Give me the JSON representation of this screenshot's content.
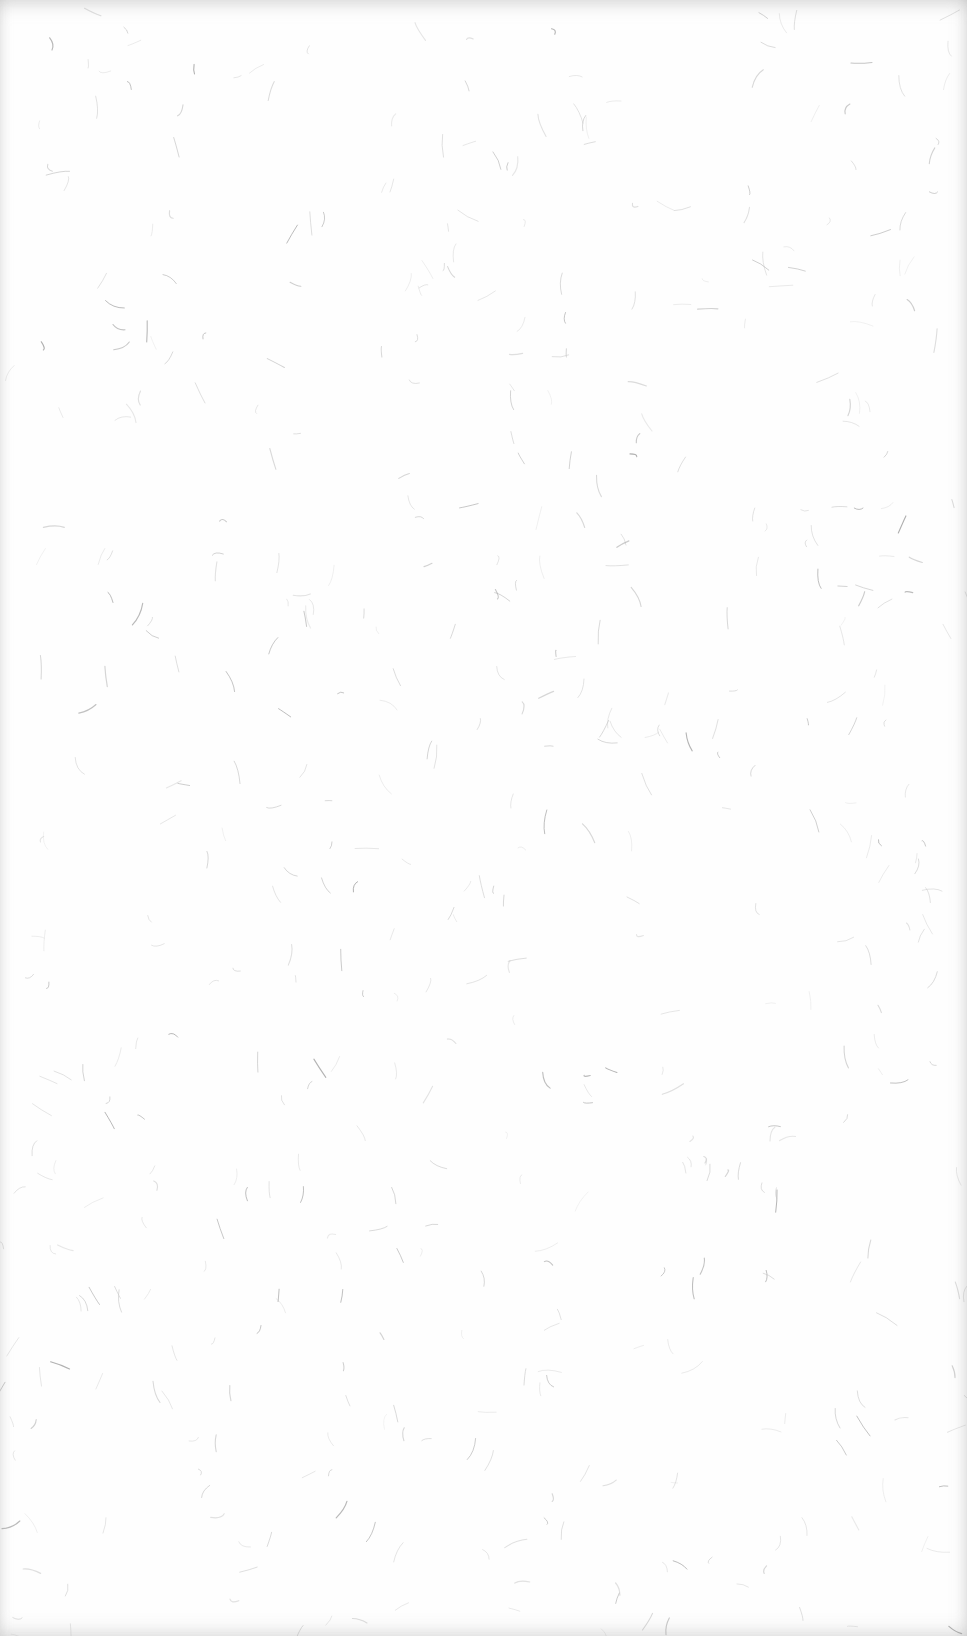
{
  "image": {
    "description": "Blank textured paper with scattered faint fibers",
    "width": 967,
    "height": 1636,
    "background_color": "#fefefe",
    "fiber_color": "#9a9a9a",
    "fiber_color_light": "#c8c8c8",
    "fiber_count": 520,
    "edge_shadow_color": "#b4b4b4"
  }
}
